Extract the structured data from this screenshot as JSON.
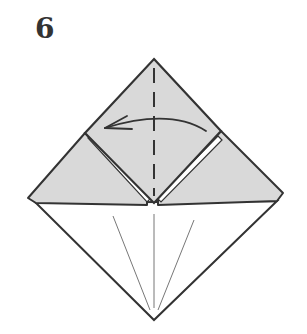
{
  "step": {
    "number": "6"
  },
  "diagram": {
    "colors": {
      "paper_colored": "#d9d9d9",
      "paper_white": "#ffffff",
      "outline": "#333333",
      "thin_line": "#666666"
    },
    "elements": [
      {
        "name": "valley-fold-line",
        "type": "dashed-vertical"
      },
      {
        "name": "fold-arrow",
        "direction": "right-to-left"
      },
      {
        "name": "left-flap",
        "shade": "colored"
      },
      {
        "name": "right-flap",
        "shade": "colored"
      },
      {
        "name": "center-square-flap",
        "shade": "colored"
      },
      {
        "name": "bottom-triangle",
        "shade": "white"
      },
      {
        "name": "crease-lines",
        "count": 3
      }
    ]
  }
}
